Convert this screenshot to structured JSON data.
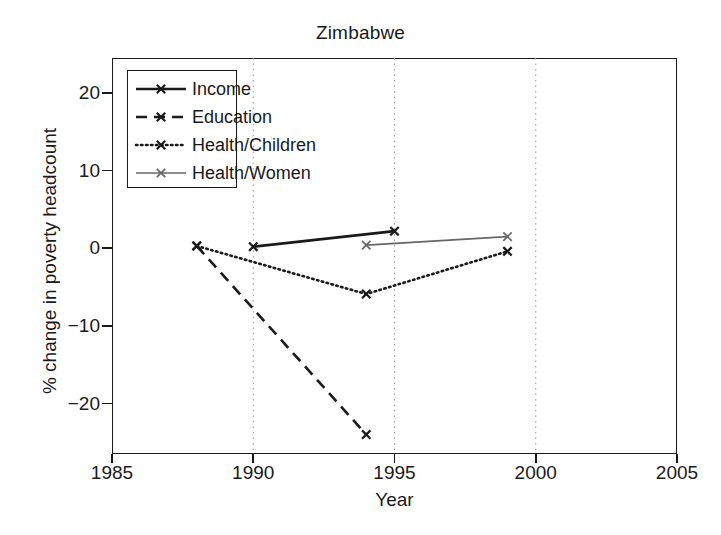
{
  "chart_data": {
    "type": "line",
    "title": "Zimbabwe",
    "xlabel": "Year",
    "ylabel": "% change in poverty headcount",
    "xlim": [
      1985,
      2005
    ],
    "ylim": [
      -26.5,
      24.5
    ],
    "xticks": [
      1985,
      1990,
      1995,
      2000,
      2005
    ],
    "yticks": [
      20,
      10,
      0,
      -10,
      -20
    ],
    "xtick_labels": [
      "1985",
      "1990",
      "1995",
      "2000",
      "2005"
    ],
    "ytick_labels": [
      "20",
      "10",
      "0",
      "−10",
      "−20"
    ],
    "grid": "vertical dotted at 1990, 1995, 2000",
    "legend_position": "upper left inside axes",
    "series": [
      {
        "name": "Income",
        "style": "solid",
        "color": "#1a1a1a",
        "marker": "x",
        "x": [
          1990,
          1995
        ],
        "y": [
          0.2,
          2.2
        ]
      },
      {
        "name": "Education",
        "style": "dashed",
        "color": "#1a1a1a",
        "marker": "x",
        "x": [
          1988,
          1994
        ],
        "y": [
          0.3,
          -24.0
        ]
      },
      {
        "name": "Health/Children",
        "style": "dotted",
        "color": "#1a1a1a",
        "marker": "x",
        "x": [
          1988,
          1994,
          1999
        ],
        "y": [
          0.3,
          -5.9,
          -0.4
        ]
      },
      {
        "name": "Health/Women",
        "style": "solid-thin",
        "color": "#666666",
        "marker": "x",
        "x": [
          1994,
          1999
        ],
        "y": [
          0.4,
          1.5
        ]
      }
    ]
  },
  "title": {
    "text": "Zimbabwe"
  },
  "axes": {
    "x_title": "Year",
    "y_title": "% change in poverty headcount",
    "x_labels": [
      "1985",
      "1990",
      "1995",
      "2000",
      "2005"
    ],
    "y_labels": [
      "20",
      "10",
      "0",
      "−10",
      "−20"
    ]
  },
  "legend": {
    "items": [
      {
        "label": "Income"
      },
      {
        "label": "Education"
      },
      {
        "label": "Health/Children"
      },
      {
        "label": "Health/Women"
      }
    ]
  },
  "colors": {
    "foreground": "#1a1a1a",
    "secondary": "#666666",
    "background": "#ffffff",
    "gridline": "#999999"
  }
}
